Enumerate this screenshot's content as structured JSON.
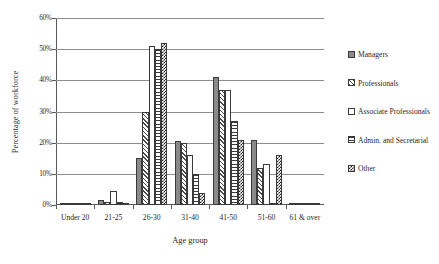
{
  "chart_data": {
    "type": "bar",
    "title": "",
    "xlabel": "Age group",
    "ylabel": "Percentage of workforce",
    "ylim": [
      0,
      60
    ],
    "yticks": [
      "0%",
      "10%",
      "20%",
      "30%",
      "40%",
      "50%",
      "60%"
    ],
    "ytick_values": [
      0,
      10,
      20,
      30,
      40,
      50,
      60
    ],
    "grid": true,
    "legend_position": "right",
    "categories": [
      "Under 20",
      "21-25",
      "26-30",
      "31-40",
      "41-50",
      "51-60",
      "61 & over"
    ],
    "series": [
      {
        "name": "Managers",
        "pattern": "solid-gray",
        "values": [
          0.2,
          1.5,
          15.0,
          20.5,
          41.0,
          21.0,
          0.4
        ]
      },
      {
        "name": "Professionals",
        "pattern": "diagonal-hatch",
        "values": [
          0.2,
          1.0,
          30.0,
          20.0,
          37.0,
          12.0,
          0.4
        ]
      },
      {
        "name": "Associate Professionals",
        "pattern": "white-empty",
        "values": [
          0.3,
          4.5,
          51.0,
          16.0,
          37.0,
          13.0,
          0.5
        ]
      },
      {
        "name": "Admin. and Secretarial",
        "pattern": "horizontal-line",
        "values": [
          0.4,
          1.0,
          50.0,
          10.0,
          27.0,
          0.6,
          0.5
        ]
      },
      {
        "name": "Other",
        "pattern": "checkerboard",
        "values": [
          0.3,
          0.5,
          52.0,
          4.0,
          21.0,
          16.0,
          0.3
        ]
      }
    ]
  },
  "legend": {
    "items": [
      {
        "label": "Managers",
        "pattern": "p-solid"
      },
      {
        "label": "Professionals",
        "pattern": "p-diag"
      },
      {
        "label": "Associate Professionals",
        "pattern": "p-empty"
      },
      {
        "label": "Admin. and Secretarial",
        "pattern": "p-horiz"
      },
      {
        "label": "Other",
        "pattern": "p-check"
      }
    ]
  }
}
